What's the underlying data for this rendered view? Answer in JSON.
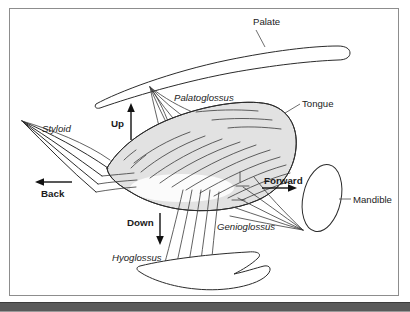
{
  "figure": {
    "background_color": "#ffffff",
    "frame_color": "#8d8d8d",
    "rule_color": "#5a5a5a",
    "tongue_fill_color": "#e2e2e2",
    "line_color": "#2b2b2b"
  },
  "structure_labels": [
    {
      "id": "palate",
      "text": "Palate",
      "style": "plain",
      "x": 253,
      "y": 25
    },
    {
      "id": "tongue",
      "text": "Tongue",
      "style": "plain",
      "x": 302,
      "y": 107
    },
    {
      "id": "mandible",
      "text": "Mandible",
      "style": "plain",
      "x": 353,
      "y": 203
    }
  ],
  "muscle_labels": [
    {
      "id": "palatoglossus",
      "text": "Palatoglossus",
      "style": "italic",
      "x": 174,
      "y": 101
    },
    {
      "id": "styloid",
      "text": "Styloid",
      "style": "italic",
      "x": 42,
      "y": 132
    },
    {
      "id": "genioglossus",
      "text": "Genioglossus",
      "style": "italic",
      "x": 217,
      "y": 230
    },
    {
      "id": "hyoglossus",
      "text": "Hyoglossus",
      "style": "italic",
      "x": 112,
      "y": 261
    }
  ],
  "direction_arrows": [
    {
      "id": "up",
      "text": "Up",
      "style": "bold",
      "x": 111,
      "y": 127,
      "direction": "up"
    },
    {
      "id": "back",
      "text": "Back",
      "style": "bold",
      "x": 41,
      "y": 197,
      "direction": "left"
    },
    {
      "id": "forward",
      "text": "Forward",
      "style": "bold",
      "x": 264,
      "y": 184,
      "direction": "right"
    },
    {
      "id": "down",
      "text": "Down",
      "style": "bold",
      "x": 127,
      "y": 226,
      "direction": "down"
    }
  ]
}
